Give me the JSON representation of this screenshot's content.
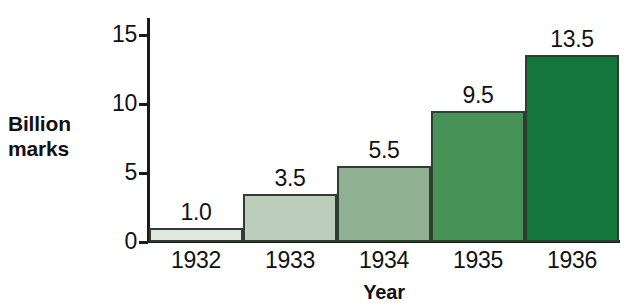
{
  "chart_data": {
    "type": "bar",
    "title": "",
    "subtitle": "",
    "xlabel": "Year",
    "ylabel": "Billion marks",
    "categories": [
      "1932",
      "1933",
      "1934",
      "1935",
      "1936"
    ],
    "values": [
      1.0,
      5.5,
      9.5,
      13.5,
      3.5
    ],
    "series": [
      {
        "name": "Billion marks",
        "values": [
          1.0,
          3.5,
          5.5,
          9.5,
          13.5
        ]
      }
    ],
    "data_labels": [
      "1.0",
      "3.5",
      "5.5",
      "9.5",
      "13.5"
    ],
    "ylim": [
      0,
      16.2
    ],
    "ytick_values": [
      0,
      5,
      10,
      15
    ],
    "ytick_labels": [
      "0",
      "5",
      "10",
      "15"
    ],
    "grid": false,
    "legend": false,
    "legend_position": "none",
    "bar_colors": [
      "#dfe7df",
      "#bdcdbb",
      "#8fb091",
      "#479257",
      "#14763c"
    ],
    "bar_border_color": "#2f3d33",
    "axis_color": "#1a1a1a",
    "background_color": "#ffffff"
  },
  "axes": {
    "y_title_text": "Billion\nmarks",
    "x_title_text": "Year"
  }
}
